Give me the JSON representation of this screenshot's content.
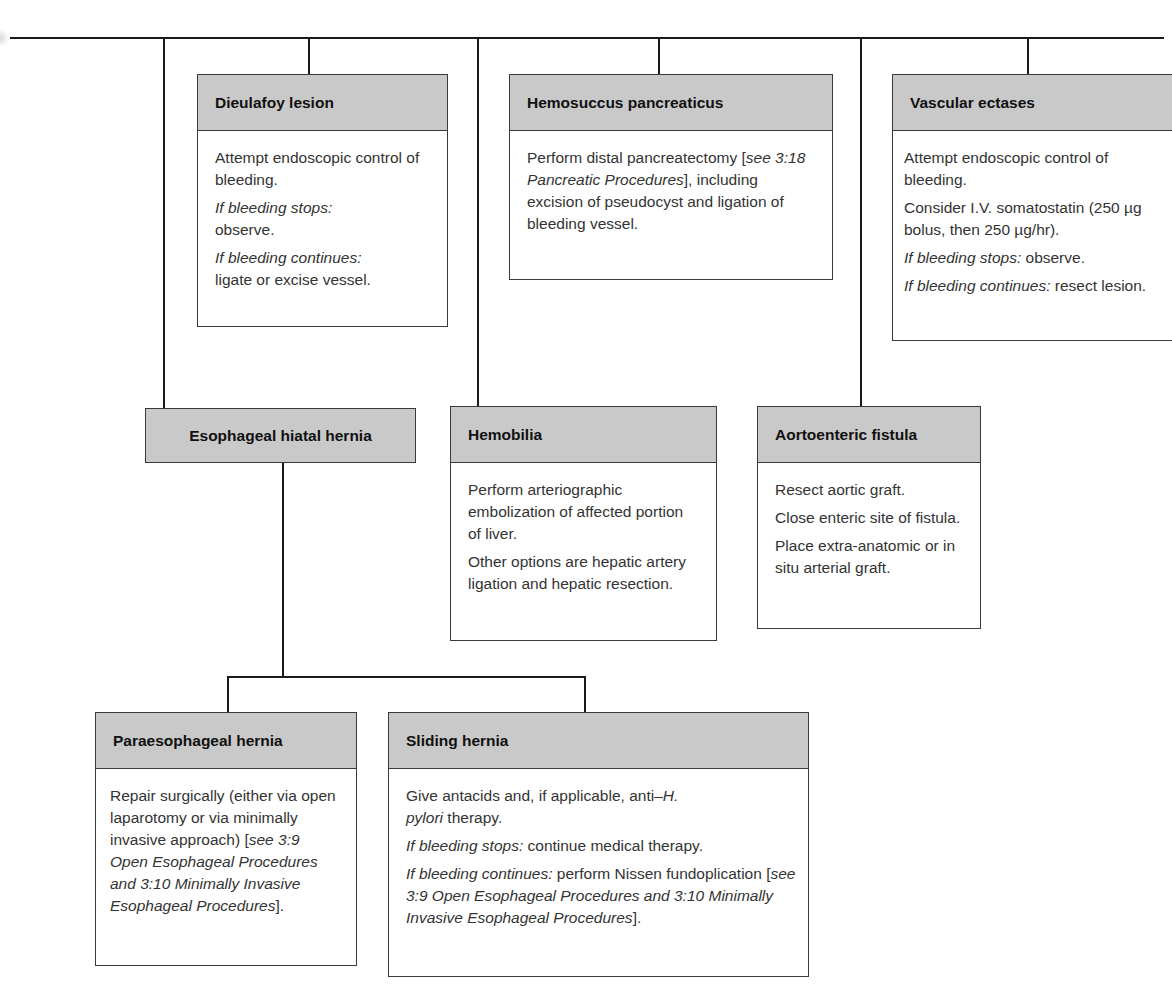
{
  "diagram": {
    "type": "treatment-algorithm-flowchart",
    "nodes": {
      "dieulafoy": {
        "title": "Dieulafoy lesion",
        "lines": [
          {
            "text": "Attempt endoscopic control of bleeding."
          },
          {
            "italic": "If bleeding stops:",
            "text": " observe."
          },
          {
            "italic": "If bleeding continues:",
            "text": " ligate or excise vessel."
          }
        ]
      },
      "hemosuccus": {
        "title": "Hemosuccus pancreaticus",
        "text_before": "Perform distal pancreatectomy [",
        "ref_italic": "see 3:18 Pancreatic Procedures",
        "text_after": "], including excision of pseudocyst and ligation of bleeding vessel."
      },
      "vascular": {
        "title": "Vascular ectases",
        "p1": "Attempt endoscopic control of bleeding.",
        "p2": "Consider I.V. somatostatin (250 µg bolus, then 250 µg/hr).",
        "p3_italic": "If bleeding stops:",
        "p3_text": " observe.",
        "p4_italic": "If bleeding continues:",
        "p4_text": " resect lesion."
      },
      "hiatal": {
        "title": "Esophageal hiatal hernia"
      },
      "hemobilia": {
        "title": "Hemobilia",
        "p1": "Perform arteriographic embolization of affected portion of liver.",
        "p2": "Other options are hepatic artery ligation and hepatic resection."
      },
      "aortoenteric": {
        "title": "Aortoenteric fistula",
        "p1": "Resect aortic graft.",
        "p2": "Close enteric site of fistula.",
        "p3": "Place extra-anatomic or in situ arterial graft."
      },
      "paraesophageal": {
        "title": "Paraesophageal hernia",
        "text_before": "Repair surgically (either via open laparotomy or via minimally invasive approach) [",
        "ref_italic": "see 3:9 Open Esophageal Procedures and 3:10 Minimally Invasive Esophageal Procedures",
        "text_after": "]."
      },
      "sliding": {
        "title": "Sliding hernia",
        "p1_before": "Give antacids and, if applicable, anti–",
        "p1_italic": "H. pylori",
        "p1_after": " therapy.",
        "p2_italic": "If bleeding stops:",
        "p2_text": " continue medical therapy.",
        "p3_italic": "If bleeding continues:",
        "p3_text": " perform Nissen fundoplication [",
        "p3_ref_italic": "see 3:9 Open Esophageal Procedures and 3:10 Minimally Invasive Esophageal Procedures",
        "p3_after": "]."
      }
    },
    "colors": {
      "header_fill": "#c9c9c9",
      "border": "#3a3a3a",
      "connector": "#1a1a1a",
      "background": "#ffffff"
    }
  }
}
